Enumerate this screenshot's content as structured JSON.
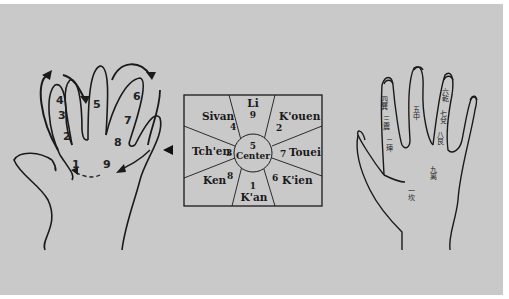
{
  "diagram": {
    "left_hand": {
      "finger_numbers": [
        "4",
        "3",
        "2",
        "5",
        "6",
        "7",
        "8",
        "1",
        "9"
      ]
    },
    "square": {
      "center_number": "5",
      "center_label": "Center",
      "sectors": [
        {
          "name": "Li",
          "number": "9"
        },
        {
          "name": "K'ouen",
          "number": "2"
        },
        {
          "name": "Touei",
          "number": "7"
        },
        {
          "name": "K'ien",
          "number": "6"
        },
        {
          "name": "K'an",
          "number": "1"
        },
        {
          "name": "Ken",
          "number": "8"
        },
        {
          "name": "Tch'en",
          "number": "3"
        },
        {
          "name": "Sivan",
          "number": "4"
        }
      ]
    },
    "right_hand": {
      "labels": [
        "四巽",
        "三震",
        "二坤",
        "五中",
        "六乾",
        "七兌",
        "八艮",
        "九离",
        "一坎"
      ]
    },
    "colors": {
      "background": "#c9c9c9",
      "ink": "#1a1a1a"
    }
  }
}
